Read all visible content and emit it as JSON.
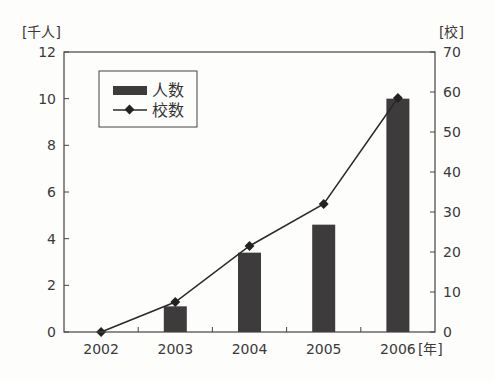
{
  "chart_data": {
    "type": "bar",
    "combo": "bar+line, dual y-axis",
    "title": "",
    "categories": [
      "2002",
      "2003",
      "2004",
      "2005",
      "2006"
    ],
    "xlabel": "[年]",
    "ylabel_left": "[千人]",
    "ylabel_right": "[校]",
    "ylim_left": [
      0,
      12
    ],
    "ylim_right": [
      0,
      70
    ],
    "yticks_left": [
      0,
      2,
      4,
      6,
      8,
      10,
      12
    ],
    "yticks_right": [
      0,
      10,
      20,
      30,
      40,
      50,
      60,
      70
    ],
    "grid": false,
    "legend_position": "upper-left inside plot",
    "series": [
      {
        "name": "人数",
        "type": "bar",
        "axis": "left",
        "color": "#3d3b3b",
        "values": [
          0,
          1.1,
          3.4,
          4.6,
          10.0
        ]
      },
      {
        "name": "校数",
        "type": "line",
        "marker": "diamond",
        "axis": "right",
        "color": "#2a2a2a",
        "values": [
          0,
          7.5,
          21.5,
          32,
          58.5
        ]
      }
    ]
  },
  "legend": {
    "items": [
      {
        "label": "人数"
      },
      {
        "label": "校数"
      }
    ]
  },
  "axes": {
    "left_unit": "[千人]",
    "right_unit": "[校]",
    "x_unit": "[年]"
  }
}
